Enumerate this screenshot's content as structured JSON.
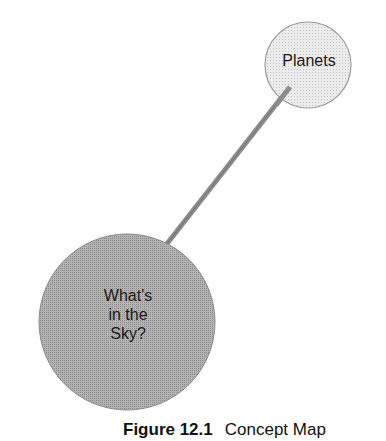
{
  "diagram": {
    "type": "concept-map",
    "nodes": [
      {
        "id": "planets",
        "label": "Planets",
        "fill": "#e6e6e6",
        "cx": 308,
        "cy": 65,
        "r": 43
      },
      {
        "id": "sky",
        "label_lines": [
          "What's",
          "in the",
          "Sky?"
        ],
        "fill": "#a9a9a9",
        "cx": 127,
        "cy": 322,
        "r": 88
      }
    ],
    "edges": [
      {
        "from": "sky",
        "to": "planets",
        "color": "#8c8c8c"
      }
    ]
  },
  "caption": {
    "figure_label": "Figure 12.1",
    "title": "Concept Map"
  }
}
